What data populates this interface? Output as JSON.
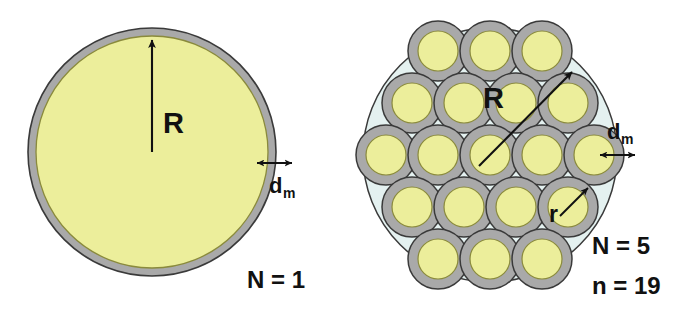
{
  "figure": {
    "colors": {
      "lumen_yellow": "#ecee9b",
      "membrane_gray": "#a9a9a9",
      "shell_blue": "#e4f1f0",
      "outline_dark": "#3a3a3a",
      "lumen_outline": "#8a8a3c",
      "arrow_black": "#111111",
      "background": "#ffffff"
    },
    "panels": [
      {
        "id": "single-fiber",
        "labels": {
          "radius": "R",
          "membrane_thickness": "d",
          "membrane_thickness_sub": "m",
          "count": "N = 1"
        },
        "geometry": {
          "cx": 152,
          "cy": 152,
          "r_outer": 124,
          "r_inner": 116
        }
      },
      {
        "id": "bundle-19-fiber",
        "labels": {
          "radius": "R",
          "fiber_radius": "r",
          "membrane_thickness": "d",
          "membrane_thickness_sub": "m",
          "count_N": "N = 5",
          "count_n": "n = 19"
        },
        "geometry": {
          "cx": 490,
          "cy": 155,
          "r_shell": 127,
          "r_fiber_outer": 30,
          "r_fiber_inner": 20,
          "rows": [
            3,
            4,
            5,
            4,
            3
          ],
          "fiber_count": 19,
          "ring_count": 5
        }
      }
    ]
  }
}
